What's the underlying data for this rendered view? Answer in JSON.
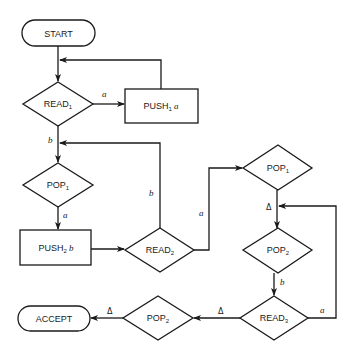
{
  "nodes": {
    "start": {
      "label": "START",
      "shape": "terminal"
    },
    "read1": {
      "label": "READ",
      "sub": "1",
      "shape": "decision"
    },
    "push1": {
      "label": "PUSH",
      "sub": "1",
      "arg": "a",
      "shape": "process"
    },
    "pop1_left": {
      "label": "POP",
      "sub": "1",
      "shape": "decision"
    },
    "push2": {
      "label": "PUSH",
      "sub": "2",
      "arg": "b",
      "shape": "process"
    },
    "read2": {
      "label": "READ",
      "sub": "2",
      "shape": "decision"
    },
    "pop1_right": {
      "label": "POP",
      "sub": "1",
      "shape": "decision"
    },
    "pop2_right": {
      "label": "POP",
      "sub": "2",
      "shape": "decision"
    },
    "read3": {
      "label": "READ",
      "sub": "3",
      "shape": "decision"
    },
    "pop2_bottom": {
      "label": "POP",
      "sub": "2",
      "shape": "decision"
    },
    "accept": {
      "label": "ACCEPT",
      "shape": "terminal"
    }
  },
  "edges": {
    "read1_to_push1": "a",
    "read1_to_pop1": "b",
    "pop1_to_push2": "a",
    "read2_to_loop": "b",
    "read2_to_pop1_right": "a",
    "pop1_right_to_pop2": "Δ",
    "pop2_to_read3": "b",
    "read3_to_loop": "a",
    "read3_to_pop2": "Δ",
    "pop2_to_accept": "Δ"
  }
}
